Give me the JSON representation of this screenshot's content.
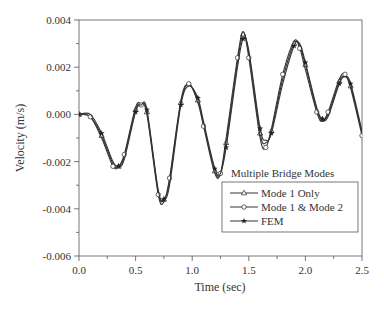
{
  "chart_data": {
    "type": "line",
    "title": "",
    "xlabel": "Time (sec)",
    "ylabel": "Velocity (m/s)",
    "xlim": [
      0.0,
      2.5
    ],
    "ylim": [
      -0.006,
      0.004
    ],
    "x_ticks": [
      "0.0",
      "0.5",
      "1.0",
      "1.5",
      "2.0",
      "2.5"
    ],
    "y_ticks": [
      "0.004",
      "0.002",
      "0.000",
      "-0.002",
      "-0.004",
      "-0.006"
    ],
    "grid": false,
    "legend_title": "Multiple Bridge Modes",
    "legend_position": "lower right inside",
    "series": [
      {
        "name": "Mode 1 Only",
        "marker": "triangle",
        "x": [
          0.0,
          0.1,
          0.2,
          0.3,
          0.35,
          0.4,
          0.5,
          0.55,
          0.6,
          0.7,
          0.75,
          0.8,
          0.9,
          0.97,
          1.05,
          1.1,
          1.2,
          1.25,
          1.3,
          1.4,
          1.45,
          1.5,
          1.6,
          1.65,
          1.7,
          1.8,
          1.9,
          1.95,
          2.0,
          2.1,
          2.15,
          2.2,
          2.3,
          2.35,
          2.4,
          2.5
        ],
        "y": [
          0.0,
          -0.0001,
          -0.0009,
          -0.0021,
          -0.0022,
          -0.0018,
          0.0002,
          0.0004,
          0.0001,
          -0.0033,
          -0.0036,
          -0.0028,
          0.0005,
          0.0013,
          0.0006,
          -0.0004,
          -0.0024,
          -0.0025,
          -0.0012,
          0.0022,
          0.0034,
          0.0026,
          -0.0008,
          -0.0012,
          -0.0007,
          0.0015,
          0.003,
          0.0029,
          0.0021,
          0.0002,
          -0.0002,
          0.0,
          0.0014,
          0.0016,
          0.0012,
          -0.0008
        ]
      },
      {
        "name": "Mode 1 & Mode 2",
        "marker": "circle",
        "x": [
          0.0,
          0.1,
          0.2,
          0.3,
          0.35,
          0.4,
          0.5,
          0.55,
          0.6,
          0.7,
          0.75,
          0.8,
          0.9,
          0.97,
          1.05,
          1.1,
          1.2,
          1.25,
          1.3,
          1.4,
          1.45,
          1.5,
          1.6,
          1.65,
          1.7,
          1.8,
          1.9,
          1.95,
          2.0,
          2.1,
          2.15,
          2.2,
          2.3,
          2.35,
          2.4,
          2.5
        ],
        "y": [
          0.0,
          -0.0001,
          -0.001,
          -0.0022,
          -0.0022,
          -0.0017,
          0.0003,
          0.0004,
          0.0,
          -0.0034,
          -0.0037,
          -0.0027,
          0.0006,
          0.0013,
          0.0005,
          -0.0005,
          -0.0025,
          -0.0025,
          -0.001,
          0.0024,
          0.0035,
          0.0024,
          -0.001,
          -0.0014,
          -0.0006,
          0.0017,
          0.0031,
          0.0028,
          0.0019,
          0.0001,
          -0.0003,
          0.0001,
          0.0015,
          0.0017,
          0.0011,
          -0.0009
        ]
      },
      {
        "name": "FEM",
        "marker": "star",
        "x": [
          0.0,
          0.1,
          0.2,
          0.3,
          0.35,
          0.4,
          0.5,
          0.55,
          0.6,
          0.7,
          0.75,
          0.8,
          0.9,
          0.97,
          1.05,
          1.1,
          1.2,
          1.25,
          1.3,
          1.4,
          1.45,
          1.5,
          1.6,
          1.65,
          1.7,
          1.8,
          1.9,
          1.95,
          2.0,
          2.1,
          2.15,
          2.2,
          2.3,
          2.35,
          2.4,
          2.5
        ],
        "y": [
          0.0,
          0.0,
          -0.0008,
          -0.002,
          -0.0022,
          -0.0019,
          0.0001,
          0.0004,
          0.0002,
          -0.0032,
          -0.0036,
          -0.003,
          0.0004,
          0.0012,
          0.0007,
          -0.0003,
          -0.0023,
          -0.0025,
          -0.0014,
          0.002,
          0.0032,
          0.0027,
          -0.0006,
          -0.0011,
          -0.0008,
          0.0013,
          0.0029,
          0.003,
          0.0022,
          0.0003,
          -0.0002,
          -0.0001,
          0.0013,
          0.0016,
          0.0013,
          -0.0007
        ]
      }
    ]
  },
  "colors": {
    "line": "#333333",
    "axis": "#555555"
  }
}
